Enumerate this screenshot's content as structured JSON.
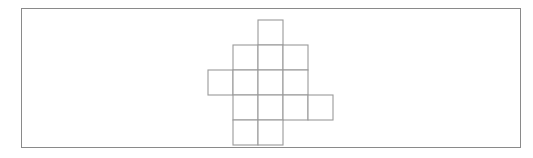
{
  "figure": {
    "kind": "polyomino-net-diagram",
    "title": "",
    "caption": "",
    "background_color": "#ffffff",
    "frame": {
      "border_color": "#8a8a8a",
      "border_width_px": 1,
      "x": 21,
      "y": 8,
      "width": 500,
      "height": 140
    },
    "grid": {
      "cell_size_px": 25,
      "origin_x": 208,
      "origin_y": 20,
      "columns": 5,
      "rows": 5,
      "line_color": "#9a9a9a",
      "line_width_px": 1.1
    },
    "cells": [
      {
        "name": "cell-top",
        "col": 2,
        "row": 0
      },
      {
        "name": "cell-upper-left",
        "col": 1,
        "row": 1
      },
      {
        "name": "cell-upper-center",
        "col": 2,
        "row": 1
      },
      {
        "name": "cell-upper-right",
        "col": 3,
        "row": 1
      },
      {
        "name": "cell-far-left",
        "col": 0,
        "row": 2
      },
      {
        "name": "cell-middle-left",
        "col": 1,
        "row": 2
      },
      {
        "name": "cell-middle-center",
        "col": 2,
        "row": 2
      },
      {
        "name": "cell-middle-right",
        "col": 3,
        "row": 2
      },
      {
        "name": "cell-lower-left",
        "col": 1,
        "row": 3
      },
      {
        "name": "cell-lower-center",
        "col": 2,
        "row": 3
      },
      {
        "name": "cell-lower-right",
        "col": 3,
        "row": 3
      },
      {
        "name": "cell-far-right",
        "col": 4,
        "row": 3
      },
      {
        "name": "cell-bottom-left",
        "col": 1,
        "row": 4
      },
      {
        "name": "cell-bottom-center",
        "col": 2,
        "row": 4
      }
    ],
    "cell_count": 14,
    "outline_color": "#8f8f8f"
  }
}
